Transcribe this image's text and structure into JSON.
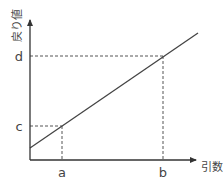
{
  "diagram": {
    "title": "",
    "x_axis_label": "引数",
    "y_axis_label": "戻り値",
    "x_ticks": [
      {
        "label": "a",
        "x": 62
      },
      {
        "label": "b",
        "x": 163
      }
    ],
    "y_ticks": [
      {
        "label": "c",
        "y": 126
      },
      {
        "label": "d",
        "y": 56
      }
    ],
    "line": {
      "x1": 30,
      "y1": 148,
      "x2": 198,
      "y2": 33
    },
    "colors": {
      "axis": "#333333",
      "line": "#444444",
      "dash": "#555555",
      "text": "#444444"
    }
  }
}
